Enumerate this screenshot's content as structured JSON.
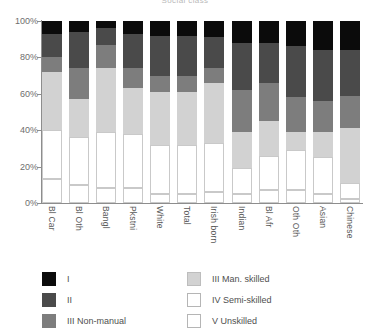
{
  "chart_data": {
    "type": "bar",
    "title": "Social class",
    "subtitle": "",
    "xlabel": "",
    "ylabel": "",
    "ylim": [
      0,
      100
    ],
    "yticks": [
      "0%",
      "20%",
      "40%",
      "60%",
      "80%",
      "100%"
    ],
    "ytick_values": [
      0,
      20,
      40,
      60,
      80,
      100
    ],
    "grid": false,
    "stacked": true,
    "stack_order": "top-to-bottom",
    "legend_position": "bottom",
    "categories": [
      "Bl Car",
      "Bl Oth",
      "Bangl",
      "Pkstni",
      "White",
      "Total",
      "Irish born",
      "Indian",
      "Bl Afr",
      "Oth Oth",
      "Asian",
      "Chinese"
    ],
    "series": [
      {
        "name": "I",
        "color": "#0b0b0b",
        "values": [
          7,
          6,
          4,
          7,
          8,
          8,
          9,
          12,
          12,
          14,
          16,
          16
        ]
      },
      {
        "name": "II",
        "color": "#4a4a4a",
        "values": [
          13,
          20,
          9,
          19,
          22,
          22,
          17,
          26,
          22,
          28,
          28,
          25
        ]
      },
      {
        "name": "III Non-manual",
        "color": "#7d7d7d",
        "values": [
          8,
          17,
          13,
          11,
          9,
          9,
          8,
          23,
          21,
          19,
          17,
          18
        ]
      },
      {
        "name": "III Man. skilled",
        "color": "#d2d2d2",
        "values": [
          32,
          21,
          35,
          25,
          29,
          29,
          33,
          20,
          19,
          10,
          14,
          30
        ]
      },
      {
        "name": "IV Semi-skilled",
        "color": "#ffffff",
        "values": [
          27,
          26,
          31,
          30,
          27,
          27,
          27,
          14,
          19,
          22,
          20,
          9
        ]
      },
      {
        "name": "V Unskilled",
        "color": "#ffffff",
        "values": [
          13,
          10,
          8,
          8,
          5,
          5,
          6,
          5,
          7,
          7,
          5,
          2
        ]
      }
    ]
  },
  "legend": {
    "items": [
      {
        "label": "I",
        "swatch": "c0"
      },
      {
        "label": "II",
        "swatch": "c1"
      },
      {
        "label": "III Non-manual",
        "swatch": "c2"
      },
      {
        "label": "III Man. skilled",
        "swatch": "c3"
      },
      {
        "label": "IV Semi-skilled",
        "swatch": "c4"
      },
      {
        "label": "V Unskilled",
        "swatch": "c5"
      }
    ]
  }
}
